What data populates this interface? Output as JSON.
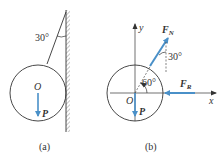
{
  "figure": {
    "panel_a": {
      "caption": "(a)",
      "angle_label": "30°",
      "center_label": "O",
      "force_label": "P"
    },
    "panel_b": {
      "caption": "(b)",
      "axis_x_label": "x",
      "axis_y_label": "y",
      "origin_label": "O",
      "angle_60_label": "60°",
      "angle_30_label": "30°",
      "force_n_label": "F",
      "force_n_sub": "N",
      "force_r_label": "F",
      "force_r_sub": "R",
      "force_p_label": "P"
    },
    "colors": {
      "force_arrow": "#4a90c8",
      "line": "#333333",
      "hatch": "#888888"
    }
  }
}
